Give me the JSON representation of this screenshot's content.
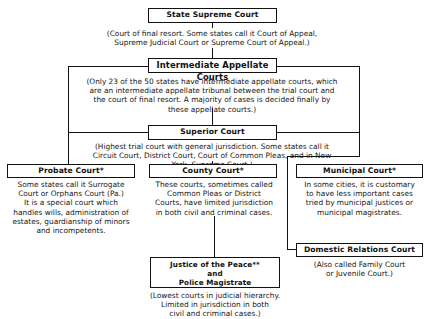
{
  "diagram": {
    "state_supreme": {
      "title": "State Supreme Court",
      "desc": [
        "(Court of final resort. Some states call it Court of Appeal,",
        "Supreme Judicial Court or Supreme Court of Appeal.)"
      ]
    },
    "intermediate": {
      "title": "Intermediate Appellate Courts",
      "desc": [
        "(Only 23 of the 50 states have intermediate appellate courts, which",
        "are an intermediate appellate tribunal between the trial court and",
        "the court of final resort. A majority of cases is decided finally by",
        "these appellate courts.)"
      ]
    },
    "superior": {
      "title": "Superior Court",
      "desc": [
        "(Highest trial court with general jurisdiction. Some states call it",
        "Circuit Court, District Court, Court of Common Pleas, and in New",
        "York, Supreme Court.)"
      ]
    },
    "probate": {
      "title": "Probate Court*",
      "desc": [
        "Some states call it Surrogate",
        "Court or Orphans Court (Pa.)",
        "It is a special court which",
        "handles wills, administration of",
        "estates, guardianship of minors",
        "and incompetents."
      ]
    },
    "county": {
      "title": "County Court*",
      "desc": [
        "These courts, sometimes called",
        "Common Pleas or District",
        "Courts, have limited jurisdiction",
        "in both civil and criminal cases."
      ]
    },
    "municipal": {
      "title": "Municipal Court*",
      "desc": [
        "In some cities, it is customary",
        "to have less important cases",
        "tried by municipal justices or",
        "municipal magistrates."
      ]
    },
    "domestic": {
      "title": "Domestic Relations Court",
      "desc": [
        "(Also called Family Court",
        "or Juvenile Court.)"
      ]
    },
    "justice": {
      "title": [
        "Justice of the Peace**",
        "and",
        "Police Magistrate"
      ],
      "desc": [
        "(Lowest courts in judicial hierarchy.",
        "Limited in jurisdiction in both",
        "civil and criminal cases.)"
      ]
    }
  }
}
